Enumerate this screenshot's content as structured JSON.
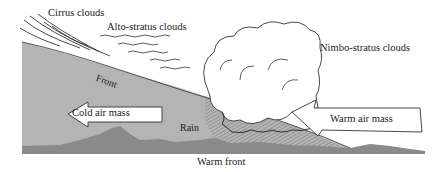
{
  "diagram": {
    "title": "Warm front",
    "labels": {
      "cirrus": "Cirrus clouds",
      "alto_stratus": "Alto-stratus clouds",
      "nimbo_stratus": "Nimbo-stratus clouds",
      "front": "Front",
      "cold_air_mass": "Cold air mass",
      "rain": "Rain",
      "warm_air_mass": "Warm air mass",
      "caption": "Warm front"
    },
    "arrows": {
      "cold_air_mass_direction": "left",
      "warm_air_mass_direction": "up-left along front"
    },
    "colors": {
      "cold_air": "#b4b4b4",
      "ground": "#8a8a8a",
      "rain_hatch": "#7a7a7a",
      "cloud_outline": "#333333",
      "background": "#ffffff"
    }
  }
}
